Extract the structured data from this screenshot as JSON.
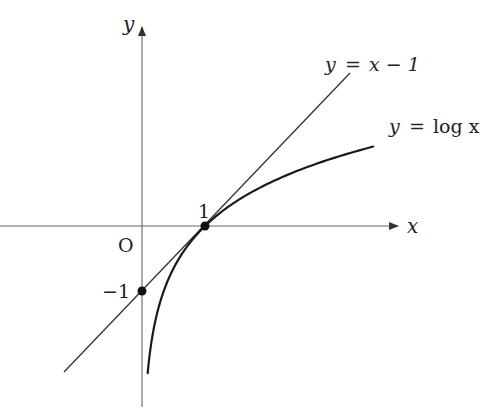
{
  "diagram": {
    "axes": {
      "x_label": "x",
      "y_label": "y",
      "origin_label": "O",
      "origin_px": [
        142,
        226
      ],
      "unit_px": [
        63,
        65
      ]
    },
    "ticks": {
      "x_one": "1",
      "y_minus_one": "−1"
    },
    "curves": [
      {
        "name": "tangent-line",
        "label_lhs": "y",
        "label_eq": "=",
        "label_rhs": "x − 1",
        "equation": "y = x - 1",
        "x_range": [
          -1.24,
          3.3
        ]
      },
      {
        "name": "log-curve",
        "label_lhs": "y",
        "label_eq": "=",
        "label_rhs": "log x",
        "equation": "y = log x",
        "x_range": [
          0.09,
          3.67
        ]
      }
    ],
    "points": [
      {
        "name": "point-1-0",
        "coords": [
          1,
          0
        ]
      },
      {
        "name": "point-0-minus1",
        "coords": [
          0,
          -1
        ]
      }
    ],
    "colors": {
      "axis": "#555555",
      "line": "#333333",
      "curve": "#1a1a1a",
      "point": "#111111",
      "text": "#222222"
    }
  }
}
